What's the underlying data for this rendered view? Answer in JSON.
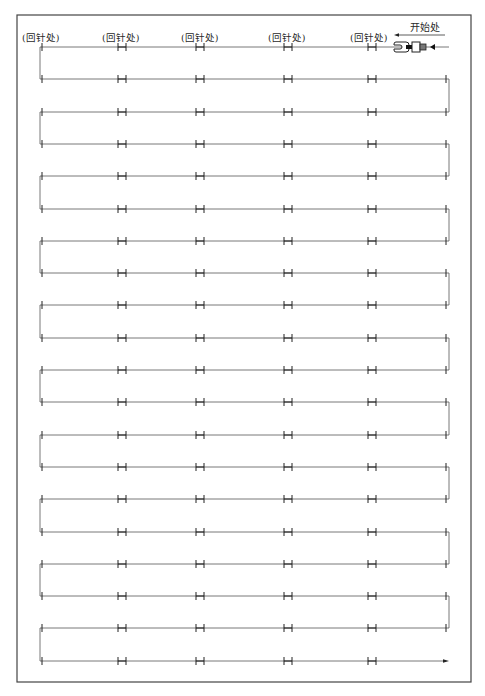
{
  "labels": {
    "backstitch": "(回针处)",
    "start": "开始处"
  },
  "backstitch_label_positions_x": [
    22,
    100,
    181,
    268,
    350
  ],
  "start_label_x": 408,
  "colors": {
    "line": "#555555",
    "frame": "#444444",
    "text": "#2a2a2a",
    "background": "#ffffff"
  },
  "frame": {
    "left": 17,
    "top": 15,
    "right": 471,
    "bottom": 682
  },
  "rows": {
    "count": 20,
    "first_y": 47,
    "spacing": 32.3,
    "x_start": 40,
    "x_end": 449
  },
  "ticks": {
    "left_single_x": 42,
    "double_x": [
      122,
      200,
      288,
      372
    ],
    "right_single_x": 446
  },
  "start_marker": {
    "arrow_from_x": 445,
    "arrow_to_x": 394,
    "arrow_y": 35,
    "presser_foot_x": 410,
    "presser_foot_y": 47
  }
}
